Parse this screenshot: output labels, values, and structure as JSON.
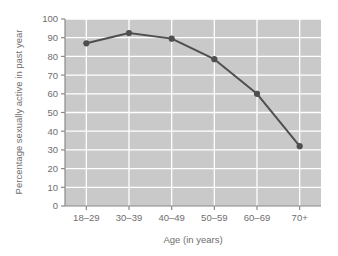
{
  "chart_data": {
    "type": "line",
    "title": "",
    "xlabel": "Age (in years)",
    "ylabel": "Percentage sexually active in past year",
    "categories": [
      "18–29",
      "30–39",
      "40–49",
      "50–59",
      "60–69",
      "70+"
    ],
    "values": [
      87,
      92.5,
      89.5,
      78.5,
      60,
      32
    ],
    "ylim": [
      0,
      100
    ],
    "yticks": [
      0,
      10,
      20,
      30,
      40,
      50,
      60,
      70,
      80,
      90,
      100
    ],
    "ytick_labels": [
      "0",
      "10",
      "20",
      "30",
      "40",
      "50",
      "60",
      "70",
      "80",
      "90",
      "100"
    ],
    "grid": true,
    "legend": false,
    "series": [
      {
        "name": "Percentage sexually active in past year",
        "values": [
          87,
          92.5,
          89.5,
          78.5,
          60,
          32
        ]
      }
    ],
    "colors": {
      "plot_background": "#c9c9c9",
      "gridline": "#ffffff",
      "line": "#4f4f4f",
      "marker": "#4f4f4f",
      "axis": "#8a8a8a",
      "text": "#6e6e6e",
      "page_background": "#ffffff"
    },
    "marker": "circle",
    "line_width": 2
  }
}
